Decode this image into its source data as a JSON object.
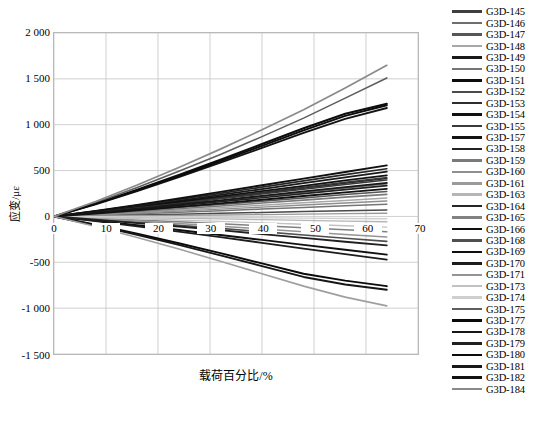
{
  "chart_data": {
    "type": "line",
    "title": "",
    "xlabel": "载荷百分比/%",
    "ylabel": "应变/με",
    "xlim": [
      0,
      70
    ],
    "ylim": [
      -1500,
      2000
    ],
    "xticks": [
      0,
      10,
      20,
      30,
      40,
      50,
      60,
      70
    ],
    "xtick_labels": [
      "0",
      "10",
      "20",
      "30",
      "40",
      "50",
      "60",
      "70"
    ],
    "yticks": [
      -1500,
      -1000,
      -500,
      0,
      500,
      1000,
      1500,
      2000
    ],
    "ytick_labels": [
      "-1 500",
      "-1 000",
      "-500",
      "0",
      "500",
      "1 000",
      "1 500",
      "2 000"
    ],
    "grid": true,
    "legend_position": "right",
    "x": [
      0,
      8,
      16,
      24,
      32,
      40,
      48,
      56,
      64
    ],
    "series": [
      {
        "name": "G3D-145",
        "color": "#3f3f3f",
        "width": 1.5,
        "values": [
          0,
          48,
          100,
          152,
          206,
          262,
          318,
          372,
          425
        ]
      },
      {
        "name": "G3D-146",
        "color": "#6e6e6e",
        "width": 1.5,
        "values": [
          0,
          40,
          84,
          128,
          172,
          218,
          264,
          310,
          356
        ]
      },
      {
        "name": "G3D-147",
        "color": "#565656",
        "width": 1.5,
        "values": [
          0,
          30,
          62,
          96,
          130,
          166,
          202,
          238,
          272
        ]
      },
      {
        "name": "G3D-148",
        "color": "#a8a8a8",
        "width": 1.5,
        "values": [
          0,
          22,
          46,
          70,
          96,
          122,
          148,
          174,
          200
        ]
      },
      {
        "name": "G3D-149",
        "color": "#1a1a1a",
        "width": 1.8,
        "values": [
          0,
          54,
          112,
          172,
          234,
          298,
          362,
          426,
          488
        ]
      },
      {
        "name": "G3D-150",
        "color": "#757575",
        "width": 1.5,
        "values": [
          0,
          14,
          30,
          46,
          62,
          80,
          98,
          116,
          134
        ]
      },
      {
        "name": "G3D-151",
        "color": "#0d0d0d",
        "width": 2.0,
        "values": [
          0,
          140,
          292,
          452,
          618,
          790,
          962,
          1120,
          1228
        ]
      },
      {
        "name": "G3D-152",
        "color": "#4a4a4a",
        "width": 1.5,
        "values": [
          0,
          8,
          16,
          25,
          34,
          43,
          53,
          62,
          70
        ]
      },
      {
        "name": "G3D-153",
        "color": "#2e2e2e",
        "width": 1.6,
        "values": [
          0,
          46,
          96,
          148,
          200,
          254,
          308,
          362,
          414
        ]
      },
      {
        "name": "G3D-154",
        "color": "#111111",
        "width": 1.8,
        "values": [
          0,
          50,
          104,
          160,
          218,
          276,
          334,
          392,
          448
        ]
      },
      {
        "name": "G3D-155",
        "color": "#3a3a3a",
        "width": 1.5,
        "values": [
          0,
          44,
          92,
          142,
          192,
          244,
          296,
          348,
          398
        ]
      },
      {
        "name": "G3D-157",
        "color": "#141414",
        "width": 1.9,
        "values": [
          0,
          132,
          276,
          428,
          586,
          748,
          910,
          1064,
          1182
        ]
      },
      {
        "name": "G3D-158",
        "color": "#222222",
        "width": 1.7,
        "values": [
          0,
          36,
          76,
          118,
          160,
          204,
          248,
          292,
          336
        ]
      },
      {
        "name": "G3D-159",
        "color": "#7a7a7a",
        "width": 1.6,
        "values": [
          0,
          26,
          54,
          84,
          114,
          146,
          178,
          210,
          240
        ]
      },
      {
        "name": "G3D-160",
        "color": "#8f8f8f",
        "width": 1.4,
        "values": [
          0,
          18,
          38,
          58,
          80,
          102,
          124,
          146,
          168
        ]
      },
      {
        "name": "G3D-161",
        "color": "#9a9a9a",
        "width": 1.4,
        "values": [
          0,
          4,
          8,
          12,
          16,
          20,
          25,
          30,
          34
        ]
      },
      {
        "name": "G3D-163",
        "color": "#b5b5b5",
        "width": 1.4,
        "values": [
          0,
          -6,
          -13,
          -20,
          -27,
          -35,
          -43,
          -51,
          -58
        ]
      },
      {
        "name": "G3D-164",
        "color": "#262626",
        "width": 1.7,
        "values": [
          0,
          58,
          120,
          186,
          252,
          320,
          388,
          456,
          520
        ]
      },
      {
        "name": "G3D-165",
        "color": "#818181",
        "width": 1.5,
        "values": [
          0,
          -18,
          -38,
          -58,
          -80,
          -102,
          -124,
          -146,
          -168
        ]
      },
      {
        "name": "G3D-166",
        "color": "#101010",
        "width": 1.9,
        "values": [
          0,
          60,
          126,
          196,
          268,
          340,
          412,
          484,
          556
        ]
      },
      {
        "name": "G3D-168",
        "color": "#4f4f4f",
        "width": 1.6,
        "values": [
          0,
          -30,
          -62,
          -96,
          -130,
          -166,
          -202,
          -238,
          -272
        ]
      },
      {
        "name": "G3D-169",
        "color": "#0f0f0f",
        "width": 1.9,
        "values": [
          0,
          -46,
          -96,
          -148,
          -202,
          -256,
          -310,
          -364,
          -416
        ]
      },
      {
        "name": "G3D-170",
        "color": "#1c1c1c",
        "width": 1.8,
        "values": [
          0,
          -52,
          -108,
          -166,
          -226,
          -288,
          -350,
          -412,
          -470
        ]
      },
      {
        "name": "G3D-171",
        "color": "#949494",
        "width": 1.5,
        "values": [
          0,
          -24,
          -50,
          -78,
          -106,
          -136,
          -166,
          -196,
          -224
        ]
      },
      {
        "name": "G3D-173",
        "color": "#c2c2c2",
        "width": 1.4,
        "values": [
          0,
          -12,
          -26,
          -40,
          -54,
          -70,
          -86,
          -102,
          -116
        ]
      },
      {
        "name": "G3D-174",
        "color": "#cfcfcf",
        "width": 1.4,
        "values": [
          0,
          -2,
          -5,
          -8,
          -11,
          -14,
          -18,
          -22,
          -26
        ]
      },
      {
        "name": "G3D-175",
        "color": "#5e5e5e",
        "width": 1.6,
        "values": [
          0,
          150,
          316,
          492,
          676,
          870,
          1072,
          1290,
          1510
        ]
      },
      {
        "name": "G3D-177",
        "color": "#0a0a0a",
        "width": 2.0,
        "values": [
          0,
          -90,
          -188,
          -292,
          -400,
          -512,
          -624,
          -700,
          -760
        ]
      },
      {
        "name": "G3D-178",
        "color": "#161616",
        "width": 1.9,
        "values": [
          0,
          -96,
          -200,
          -310,
          -424,
          -542,
          -660,
          -742,
          -800
        ]
      },
      {
        "name": "G3D-179",
        "color": "#202020",
        "width": 1.8,
        "values": [
          0,
          -34,
          -72,
          -110,
          -150,
          -192,
          -234,
          -276,
          -316
        ]
      },
      {
        "name": "G3D-180",
        "color": "#0c0c0c",
        "width": 1.9,
        "values": [
          0,
          136,
          284,
          440,
          602,
          770,
          938,
          1096,
          1212
        ]
      },
      {
        "name": "G3D-181",
        "color": "#181818",
        "width": 1.8,
        "values": [
          0,
          40,
          84,
          130,
          176,
          224,
          272,
          320,
          366
        ]
      },
      {
        "name": "G3D-182",
        "color": "#121212",
        "width": 1.9,
        "values": [
          0,
          32,
          68,
          104,
          142,
          182,
          222,
          262,
          300
        ]
      },
      {
        "name": "G3D-184",
        "color": "#8a8a8a",
        "width": 1.7,
        "values": [
          0,
          162,
          342,
          534,
          734,
          944,
          1164,
          1400,
          1648
        ]
      },
      {
        "name": "G3D-185",
        "color": "#9f9f9f",
        "width": 1.6,
        "values": [
          0,
          -110,
          -230,
          -356,
          -488,
          -624,
          -760,
          -880,
          -975
        ]
      }
    ]
  },
  "legend": {
    "items": [
      {
        "label": "G3D-145"
      },
      {
        "label": "G3D-146"
      },
      {
        "label": "G3D-147"
      },
      {
        "label": "G3D-148"
      },
      {
        "label": "G3D-149"
      },
      {
        "label": "G3D-150"
      },
      {
        "label": "G3D-151"
      },
      {
        "label": "G3D-152"
      },
      {
        "label": "G3D-153"
      },
      {
        "label": "G3D-154"
      },
      {
        "label": "G3D-155"
      },
      {
        "label": "G3D-157"
      },
      {
        "label": "G3D-158"
      },
      {
        "label": "G3D-159"
      },
      {
        "label": "G3D-160"
      },
      {
        "label": "G3D-161"
      },
      {
        "label": "G3D-163"
      },
      {
        "label": "G3D-164"
      },
      {
        "label": "G3D-165"
      },
      {
        "label": "G3D-166"
      },
      {
        "label": "G3D-168"
      },
      {
        "label": "G3D-169"
      },
      {
        "label": "G3D-170"
      },
      {
        "label": "G3D-171"
      },
      {
        "label": "G3D-173"
      },
      {
        "label": "G3D-174"
      },
      {
        "label": "G3D-175"
      },
      {
        "label": "G3D-177"
      },
      {
        "label": "G3D-178"
      },
      {
        "label": "G3D-179"
      },
      {
        "label": "G3D-180"
      },
      {
        "label": "G3D-181"
      },
      {
        "label": "G3D-182"
      },
      {
        "label": "G3D-184"
      }
    ]
  }
}
